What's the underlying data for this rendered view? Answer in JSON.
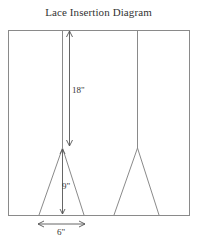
{
  "title": "Lace Insertion Diagram",
  "colors": {
    "line": "#8a8a8a",
    "arrow": "#555555",
    "text": "#333333",
    "background": "#ffffff"
  },
  "frame": {
    "x": 8,
    "y": 30,
    "width": 181,
    "height": 185
  },
  "insertions": [
    {
      "name": "left-insertion",
      "line_x": 62,
      "apex": {
        "x": 62,
        "y": 148
      },
      "base_left": {
        "x": 39,
        "y": 215
      },
      "base_right": {
        "x": 84,
        "y": 215
      }
    },
    {
      "name": "right-insertion",
      "line_x": 137,
      "apex": {
        "x": 137,
        "y": 148
      },
      "base_left": {
        "x": 114,
        "y": 215
      },
      "base_right": {
        "x": 159,
        "y": 215
      }
    }
  ],
  "dimensions": {
    "top_length": {
      "label": "18\"",
      "x": 69,
      "from_y": 31,
      "to_y": 146
    },
    "triangle_height": {
      "label": "9\"",
      "x": 62,
      "from_y": 149,
      "to_y": 214
    },
    "base_width": {
      "label": "6\"",
      "y": 224,
      "from_x": 38,
      "to_x": 85
    }
  }
}
